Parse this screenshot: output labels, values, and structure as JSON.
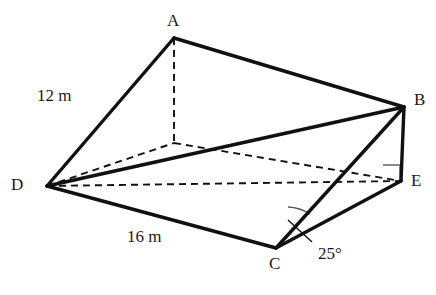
{
  "figure": {
    "type": "geometry-diagram",
    "background_color": "#ffffff",
    "line_color": "#111111",
    "hidden_line_color": "#111111",
    "right_angle_color": "#8c8c8c",
    "arc_color": "#555555"
  },
  "vertices": [
    {
      "id": "A",
      "label": "A",
      "x": 174,
      "y": 38,
      "label_x": 167,
      "label_y": 12,
      "hidden": false
    },
    {
      "id": "B",
      "label": "B",
      "x": 404,
      "y": 107,
      "label_x": 414,
      "label_y": 91,
      "hidden": false
    },
    {
      "id": "C",
      "label": "C",
      "x": 276,
      "y": 248,
      "label_x": 269,
      "label_y": 255,
      "hidden": false
    },
    {
      "id": "D",
      "label": "D",
      "x": 47,
      "y": 186,
      "label_x": 11,
      "label_y": 176,
      "hidden": false
    },
    {
      "id": "E",
      "label": "E",
      "x": 401,
      "y": 181,
      "label_x": 411,
      "label_y": 172,
      "hidden": false
    },
    {
      "id": "F",
      "label": "",
      "x": 174,
      "y": 143,
      "label_x": 0,
      "label_y": 0,
      "hidden": true
    }
  ],
  "edges": [
    {
      "from": "A",
      "to": "B",
      "style": "solid"
    },
    {
      "from": "A",
      "to": "D",
      "style": "solid"
    },
    {
      "from": "D",
      "to": "B",
      "style": "solid"
    },
    {
      "from": "D",
      "to": "C",
      "style": "solid"
    },
    {
      "from": "C",
      "to": "B",
      "style": "solid"
    },
    {
      "from": "C",
      "to": "E",
      "style": "solid"
    },
    {
      "from": "B",
      "to": "E",
      "style": "solid"
    },
    {
      "from": "A",
      "to": "F",
      "style": "dashed"
    },
    {
      "from": "D",
      "to": "F",
      "style": "dashed"
    },
    {
      "from": "F",
      "to": "E",
      "style": "dashed"
    },
    {
      "from": "D",
      "to": "E",
      "style": "dashed"
    }
  ],
  "measurements": [
    {
      "id": "len-AD",
      "text": "12 m",
      "x": 37,
      "y": 87,
      "edge": "A-D"
    },
    {
      "id": "len-DC",
      "text": "16 m",
      "x": 127,
      "y": 228,
      "edge": "D-C"
    }
  ],
  "angles": [
    {
      "id": "angle-BCE",
      "text": "25°",
      "vertex": "C",
      "between": [
        "C-B",
        "C-E"
      ],
      "label_x": 318,
      "label_y": 245,
      "leader": {
        "x1": 312,
        "y1": 242,
        "x2": 288,
        "y2": 220
      },
      "arc_radius": 44
    }
  ],
  "right_angles": [
    {
      "id": "right-angle-E",
      "vertex": "E",
      "size": 17,
      "text": ""
    }
  ]
}
